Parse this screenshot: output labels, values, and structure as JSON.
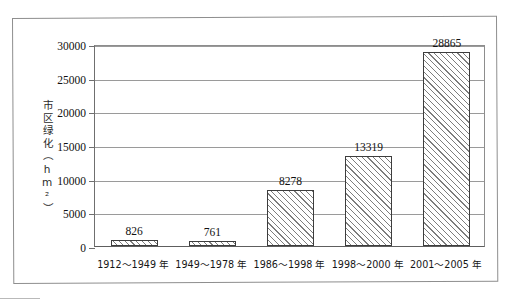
{
  "figure": {
    "frame_color": "#8e8e8e",
    "bar_edge_color": "#3d3d3d",
    "hatch_color": "#7d7d7d",
    "grid_color": "#9a9a9a"
  },
  "chart_data": {
    "type": "bar",
    "title": "",
    "xlabel": "",
    "ylabel": "市区绿化（hm²）",
    "ylim": [
      0,
      30000
    ],
    "ytick_labels": [
      "0",
      "5000",
      "10000",
      "15000",
      "20000",
      "25000",
      "30000"
    ],
    "ytick_values": [
      0,
      5000,
      10000,
      15000,
      20000,
      25000,
      30000
    ],
    "grid": "horizontal",
    "legend": "none",
    "categories": [
      "1912～1949 年",
      "1949～1978 年",
      "1986～1998 年",
      "1998～2000 年",
      "2001～2005 年"
    ],
    "values": [
      826,
      761,
      8278,
      13319,
      28865
    ],
    "data_labels": [
      "826",
      "761",
      "8278",
      "13319",
      "28865"
    ]
  }
}
